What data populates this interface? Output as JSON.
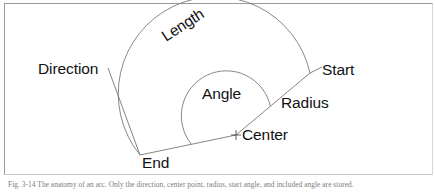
{
  "figure": {
    "labels": {
      "direction": "Direction",
      "length": "Length",
      "start": "Start",
      "angle": "Angle",
      "radius": "Radius",
      "center": "Center",
      "end": "End"
    },
    "geometry": {
      "center_x": 236,
      "center_y": 135,
      "start_x": 310,
      "start_y": 73,
      "end_x": 140,
      "end_y": 155,
      "outer_radius": 97,
      "inner_radius": 45,
      "direction_leader_start_x": 108,
      "direction_leader_start_y": 68
    },
    "colors": {
      "stroke": "#6e6e6e",
      "text": "#111111",
      "frame": "#9a9a9a",
      "background": "#ffffff"
    }
  },
  "caption": {
    "text": "Fig. 3-14  The anatomy of an arc. Only the direction, center point, radius, start angle, and included angle are stored."
  }
}
